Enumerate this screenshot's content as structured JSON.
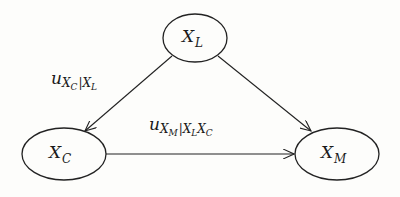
{
  "diagram": {
    "type": "directed-graph",
    "nodes": [
      {
        "id": "XL",
        "base": "X",
        "sub": "L",
        "cx": 195,
        "cy": 38,
        "rx": 32,
        "ry": 24
      },
      {
        "id": "XC",
        "base": "X",
        "sub": "C",
        "cx": 64,
        "cy": 154,
        "rx": 42,
        "ry": 26
      },
      {
        "id": "XM",
        "base": "X",
        "sub": "M",
        "cx": 337,
        "cy": 154,
        "rx": 42,
        "ry": 26
      }
    ],
    "edges": [
      {
        "from": "XL",
        "to": "XC",
        "label": "u_{X_C|X_L}"
      },
      {
        "from": "XL",
        "to": "XM",
        "label": ""
      },
      {
        "from": "XC",
        "to": "XM",
        "label": "u_{X_M|X_L X_C}"
      }
    ],
    "labels": {
      "xl": {
        "base": "X",
        "sub": "L"
      },
      "xc": {
        "base": "X",
        "sub": "C"
      },
      "xm": {
        "base": "X",
        "sub": "M"
      },
      "edge_lc": {
        "u": "u",
        "x1": "X",
        "s1": "C",
        "bar": "|",
        "x2": "X",
        "s2": "L"
      },
      "edge_cm": {
        "u": "u",
        "x1": "X",
        "s1": "M",
        "bar": "|",
        "x2": "X",
        "s2": "L",
        "x3": "X",
        "s3": "C"
      }
    },
    "colors": {
      "stroke": "#222222",
      "background": "#fdfdfb"
    }
  }
}
